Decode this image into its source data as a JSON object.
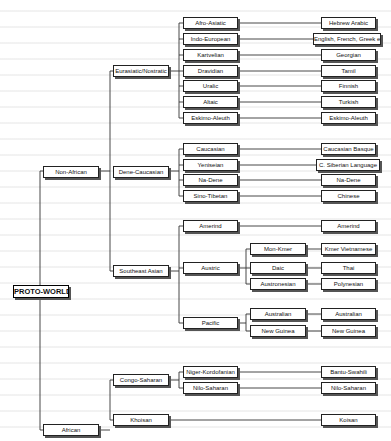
{
  "root": {
    "label": "PROTO-WORLD",
    "x": 13,
    "y": 285,
    "w": 54
  },
  "nodes": [
    {
      "id": "non-african",
      "label": "Non-African",
      "x": 43,
      "y": 166,
      "w": 54
    },
    {
      "id": "african",
      "label": "African",
      "x": 43,
      "y": 424,
      "w": 54
    },
    {
      "id": "eurasiatic",
      "label": "Eurasiatic/Nostratic",
      "x": 113,
      "y": 65,
      "w": 54
    },
    {
      "id": "dene-caucasian",
      "label": "Dene-Caucasian",
      "x": 113,
      "y": 166,
      "w": 54
    },
    {
      "id": "southeast-asian",
      "label": "Southeast Asian",
      "x": 113,
      "y": 265,
      "w": 54
    },
    {
      "id": "congo-saharan",
      "label": "Congo-Saharan",
      "x": 113,
      "y": 374,
      "w": 54
    },
    {
      "id": "khoisan-group",
      "label": "Khoisan",
      "x": 113,
      "y": 414,
      "w": 54
    },
    {
      "id": "afro-asiatic",
      "label": "Afro-Asiatic",
      "x": 183,
      "y": 17,
      "w": 53
    },
    {
      "id": "indo-european",
      "label": "Indo-European",
      "x": 183,
      "y": 33,
      "w": 53
    },
    {
      "id": "kartvelian",
      "label": "Kartvelian",
      "x": 183,
      "y": 49,
      "w": 53
    },
    {
      "id": "dravidian",
      "label": "Dravidian",
      "x": 183,
      "y": 65,
      "w": 53
    },
    {
      "id": "uralic",
      "label": "Uralic",
      "x": 183,
      "y": 80,
      "w": 53
    },
    {
      "id": "altaic",
      "label": "Altaic",
      "x": 183,
      "y": 96,
      "w": 53
    },
    {
      "id": "eskimo-aleuth",
      "label": "Eskimo-Aleuth",
      "x": 183,
      "y": 112,
      "w": 53
    },
    {
      "id": "caucasian",
      "label": "Caucasian",
      "x": 183,
      "y": 143,
      "w": 53
    },
    {
      "id": "yeniseian",
      "label": "Yeniseian",
      "x": 183,
      "y": 159,
      "w": 53
    },
    {
      "id": "na-dene",
      "label": "Na-Dene",
      "x": 183,
      "y": 174,
      "w": 53
    },
    {
      "id": "sino-tibetan",
      "label": "Sino-Tibetan",
      "x": 183,
      "y": 190,
      "w": 53
    },
    {
      "id": "amerind",
      "label": "Amerind",
      "x": 183,
      "y": 220,
      "w": 53
    },
    {
      "id": "austric",
      "label": "Austric",
      "x": 183,
      "y": 262,
      "w": 53
    },
    {
      "id": "pacific",
      "label": "Pacific",
      "x": 183,
      "y": 317,
      "w": 53
    },
    {
      "id": "niger-kordofanian",
      "label": "Niger-Kordofanian",
      "x": 183,
      "y": 366,
      "w": 53
    },
    {
      "id": "nilo-saharan",
      "label": "Nilo-Saharan",
      "x": 183,
      "y": 382,
      "w": 53
    },
    {
      "id": "mon-kmer",
      "label": "Mon-Kmer",
      "x": 250,
      "y": 243,
      "w": 54
    },
    {
      "id": "daic",
      "label": "Daic",
      "x": 250,
      "y": 262,
      "w": 54
    },
    {
      "id": "austronesian",
      "label": "Austronesian",
      "x": 250,
      "y": 278,
      "w": 54
    },
    {
      "id": "australian",
      "label": "Australian",
      "x": 250,
      "y": 308,
      "w": 54
    },
    {
      "id": "new-guinea",
      "label": "New Guinea",
      "x": 250,
      "y": 325,
      "w": 54
    },
    {
      "id": "hebrew-arabic",
      "label": "Hebrew Arabic",
      "x": 321,
      "y": 17,
      "w": 53
    },
    {
      "id": "english-french-greek",
      "label": "English, French, Greek etc",
      "x": 313,
      "y": 33,
      "w": 66
    },
    {
      "id": "georgian",
      "label": "Georgian",
      "x": 321,
      "y": 49,
      "w": 53
    },
    {
      "id": "tamil",
      "label": "Tamil",
      "x": 321,
      "y": 65,
      "w": 53
    },
    {
      "id": "finnish",
      "label": "Finnish",
      "x": 321,
      "y": 80,
      "w": 53
    },
    {
      "id": "turkish",
      "label": "Turkish",
      "x": 321,
      "y": 96,
      "w": 53
    },
    {
      "id": "eskimo-aleuth-lang",
      "label": "Eskimo-Aleuth",
      "x": 321,
      "y": 112,
      "w": 53
    },
    {
      "id": "caucasian-basque",
      "label": "Caucasian Basque",
      "x": 321,
      "y": 143,
      "w": 53
    },
    {
      "id": "c-siberian",
      "label": "C. Siberian Language",
      "x": 316,
      "y": 159,
      "w": 62
    },
    {
      "id": "na-dene-lang",
      "label": "Na-Dene",
      "x": 321,
      "y": 174,
      "w": 53
    },
    {
      "id": "chinese",
      "label": "Chinese",
      "x": 321,
      "y": 190,
      "w": 53
    },
    {
      "id": "amerind-lang",
      "label": "Amerind",
      "x": 321,
      "y": 220,
      "w": 53
    },
    {
      "id": "kmer-vietnamese",
      "label": "Kmer Vietnamese",
      "x": 321,
      "y": 243,
      "w": 53
    },
    {
      "id": "thai",
      "label": "Thai",
      "x": 321,
      "y": 262,
      "w": 53
    },
    {
      "id": "polynesian",
      "label": "Polynesian",
      "x": 321,
      "y": 278,
      "w": 53
    },
    {
      "id": "australian-lang",
      "label": "Australian",
      "x": 321,
      "y": 308,
      "w": 53
    },
    {
      "id": "new-guinea-lang",
      "label": "New Guinea",
      "x": 321,
      "y": 325,
      "w": 53
    },
    {
      "id": "bantu-swahili",
      "label": "Bantu-Swahili",
      "x": 321,
      "y": 366,
      "w": 53
    },
    {
      "id": "nilo-saharan-lang",
      "label": "Nilo-Saharan",
      "x": 321,
      "y": 382,
      "w": 53
    },
    {
      "id": "koisan",
      "label": "Koisan",
      "x": 321,
      "y": 414,
      "w": 53
    }
  ],
  "lines": [
    [
      40,
      171,
      40,
      430
    ],
    [
      40,
      291,
      13,
      291
    ],
    [
      40,
      171,
      43,
      171
    ],
    [
      40,
      430,
      43,
      430
    ],
    [
      98,
      171,
      110,
      171
    ],
    [
      110,
      71,
      110,
      271
    ],
    [
      110,
      71,
      113,
      71
    ],
    [
      110,
      271,
      113,
      271
    ],
    [
      98,
      430,
      110,
      430
    ],
    [
      110,
      380,
      110,
      420
    ],
    [
      110,
      380,
      113,
      380
    ],
    [
      110,
      420,
      113,
      420
    ],
    [
      168,
      71,
      179,
      71
    ],
    [
      179,
      23,
      179,
      118
    ],
    [
      179,
      23,
      183,
      23
    ],
    [
      179,
      39,
      183,
      39
    ],
    [
      179,
      55,
      183,
      55
    ],
    [
      179,
      71,
      183,
      71
    ],
    [
      179,
      86,
      183,
      86
    ],
    [
      179,
      102,
      183,
      102
    ],
    [
      179,
      118,
      183,
      118
    ],
    [
      168,
      171,
      179,
      171
    ],
    [
      179,
      149,
      179,
      196
    ],
    [
      179,
      149,
      183,
      149
    ],
    [
      179,
      165,
      183,
      165
    ],
    [
      179,
      180,
      183,
      180
    ],
    [
      179,
      196,
      183,
      196
    ],
    [
      168,
      271,
      179,
      271
    ],
    [
      179,
      226,
      179,
      323
    ],
    [
      179,
      226,
      183,
      226
    ],
    [
      179,
      268,
      183,
      268
    ],
    [
      179,
      323,
      183,
      323
    ],
    [
      168,
      380,
      179,
      380
    ],
    [
      179,
      372,
      179,
      388
    ],
    [
      179,
      372,
      183,
      372
    ],
    [
      179,
      388,
      183,
      388
    ],
    [
      237,
      268,
      246,
      268
    ],
    [
      246,
      249,
      246,
      284
    ],
    [
      246,
      249,
      250,
      249
    ],
    [
      246,
      268,
      250,
      268
    ],
    [
      246,
      284,
      250,
      284
    ],
    [
      237,
      323,
      246,
      323
    ],
    [
      246,
      314,
      246,
      331
    ],
    [
      246,
      314,
      250,
      314
    ],
    [
      246,
      331,
      250,
      331
    ],
    [
      237,
      23,
      321,
      23
    ],
    [
      237,
      39,
      313,
      39
    ],
    [
      237,
      55,
      321,
      55
    ],
    [
      237,
      71,
      321,
      71
    ],
    [
      237,
      86,
      321,
      86
    ],
    [
      237,
      102,
      321,
      102
    ],
    [
      237,
      118,
      321,
      118
    ],
    [
      237,
      149,
      321,
      149
    ],
    [
      237,
      165,
      316,
      165
    ],
    [
      237,
      180,
      321,
      180
    ],
    [
      237,
      196,
      321,
      196
    ],
    [
      237,
      226,
      321,
      226
    ],
    [
      305,
      249,
      321,
      249
    ],
    [
      305,
      268,
      321,
      268
    ],
    [
      305,
      284,
      321,
      284
    ],
    [
      305,
      314,
      321,
      314
    ],
    [
      305,
      331,
      321,
      331
    ],
    [
      237,
      372,
      321,
      372
    ],
    [
      237,
      388,
      321,
      388
    ],
    [
      168,
      420,
      321,
      420
    ]
  ],
  "colors": {
    "line": "#333333",
    "box_border": "#222222",
    "shadow": "#555555",
    "background": "#ffffff"
  }
}
